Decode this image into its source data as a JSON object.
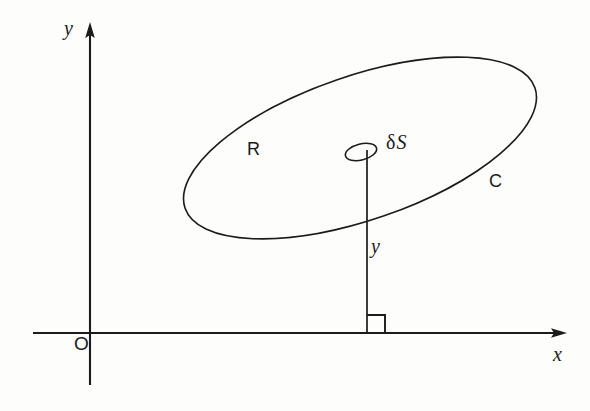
{
  "figure": {
    "background_color": "#fdfdfc",
    "ink_color": "#1b1b1b"
  },
  "axes": {
    "x_axis": {
      "label": "x",
      "style": "italic",
      "arrow": "right",
      "line_y": 333,
      "line_x_start": 33,
      "line_x_end": 567
    },
    "y_axis": {
      "label": "y",
      "style": "italic",
      "arrow": "up",
      "line_x": 90,
      "line_y_start": 22,
      "line_y_end": 385
    },
    "origin": {
      "label": "O",
      "style": "upright"
    }
  },
  "shapes": {
    "region": {
      "label": "R",
      "style": "upright",
      "description": "tilted ellipse interior"
    },
    "boundary_curve": {
      "label": "C",
      "style": "upright",
      "description": "tilted ellipse outline",
      "center_x": 360,
      "center_y": 148,
      "radius_x": 185,
      "radius_y": 72,
      "rotation_deg": -19
    },
    "surface_element": {
      "label": "δS",
      "delta_symbol": "δ",
      "s_symbol": "S",
      "center_x": 361,
      "center_y": 152,
      "radius_x": 16,
      "radius_y": 8,
      "rotation_deg": -14
    },
    "height_segment": {
      "label": "y",
      "style": "italic",
      "x": 367,
      "y_top": 152,
      "y_bottom": 333
    },
    "right_angle_marker": {
      "size": 18,
      "x": 367,
      "y": 333,
      "description": "square marking perpendicular foot on x-axis"
    }
  }
}
